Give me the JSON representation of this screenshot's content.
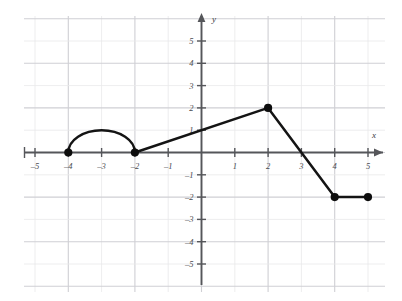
{
  "figure": {
    "title": "",
    "background_color": "#ffffff",
    "grid_color": "#e8e8ea",
    "grid_major_color": "#cfcfd4",
    "axis_color": "#55565a",
    "curve_color": "#141414"
  },
  "axes": {
    "x_label": "x",
    "y_label": "y",
    "x_ticks": [
      {
        "value": -5,
        "label": "–5"
      },
      {
        "value": -4,
        "label": "–4"
      },
      {
        "value": -3,
        "label": "–3"
      },
      {
        "value": -2,
        "label": "–2"
      },
      {
        "value": -1,
        "label": "–1"
      },
      {
        "value": 1,
        "label": "1"
      },
      {
        "value": 2,
        "label": "2"
      },
      {
        "value": 3,
        "label": "3"
      },
      {
        "value": 4,
        "label": "4"
      },
      {
        "value": 5,
        "label": "5"
      }
    ],
    "y_ticks": [
      {
        "value": 5,
        "label": "5"
      },
      {
        "value": 4,
        "label": "4"
      },
      {
        "value": 3,
        "label": "3"
      },
      {
        "value": 2,
        "label": "2"
      },
      {
        "value": 1,
        "label": "1"
      },
      {
        "value": -1,
        "label": "–1"
      },
      {
        "value": -2,
        "label": "–2"
      },
      {
        "value": -3,
        "label": "–3"
      },
      {
        "value": -4,
        "label": "–4"
      },
      {
        "value": -5,
        "label": "–5"
      }
    ]
  },
  "chart_data": {
    "type": "line",
    "title": "",
    "xlabel": "x",
    "ylabel": "y",
    "xlim": [
      -5.6,
      5.6
    ],
    "ylim": [
      -5.6,
      5.6
    ],
    "grid": true,
    "legend": "none",
    "series": [
      {
        "name": "semicircle-arc",
        "shape": "semicircle",
        "center": [
          -3,
          0
        ],
        "radius": 1,
        "from": [
          -4,
          0
        ],
        "to": [
          -2,
          0
        ],
        "apex": [
          -3,
          1
        ],
        "direction": "upper-half"
      },
      {
        "name": "rising-segment",
        "shape": "segment",
        "points": [
          [
            -2,
            0
          ],
          [
            2,
            2
          ]
        ],
        "slope": 0.5,
        "y_intercept": 1
      },
      {
        "name": "falling-segment",
        "shape": "segment",
        "points": [
          [
            2,
            2
          ],
          [
            4,
            -2
          ]
        ],
        "slope": -2,
        "x_intercept": 3
      },
      {
        "name": "horizontal-segment",
        "shape": "segment",
        "points": [
          [
            4,
            -2
          ],
          [
            5,
            -2
          ]
        ],
        "slope": 0
      }
    ],
    "marked_points": [
      {
        "x": -4,
        "y": 0,
        "style": "filled"
      },
      {
        "x": -2,
        "y": 0,
        "style": "filled"
      },
      {
        "x": 2,
        "y": 2,
        "style": "filled"
      },
      {
        "x": 4,
        "y": -2,
        "style": "filled"
      },
      {
        "x": 5,
        "y": -2,
        "style": "filled"
      }
    ],
    "x_intercepts": [
      -4,
      -2,
      3
    ],
    "y_intercepts": [
      1
    ]
  }
}
